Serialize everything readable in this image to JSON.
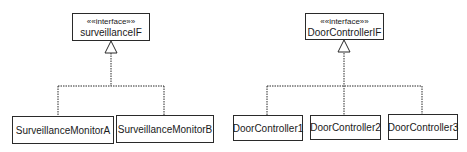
{
  "diagram": {
    "left": {
      "interface": {
        "stereotype": "««interface»»",
        "name": "surveillanceIF"
      },
      "implementations": [
        "SurveillanceMonitorA",
        "SurveillanceMonitorB"
      ]
    },
    "right": {
      "interface": {
        "stereotype": "««interface»»",
        "name": "DoorControllerIF"
      },
      "implementations": [
        "DoorController1",
        "DoorController2",
        "DoorController3"
      ]
    },
    "relationship": "realization",
    "line_color": "#2a2a2a"
  }
}
